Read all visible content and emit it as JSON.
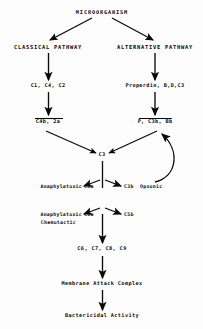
{
  "figure": {
    "type": "flowchart",
    "background_color": "#fdfdfd",
    "ink_color": "#0a0a0a"
  },
  "nodes": {
    "microorganism": "MICROORGANISM",
    "classical_pathway": "CLASSICAL PATHWAY",
    "alternative_pathway": "ALTERNATIVE PATHWAY",
    "classical_components": "C1, C4, C2",
    "alternative_components": "Properdin, B,D,C3",
    "classical_convertase": "C4b, 2a",
    "alternative_convertase": "P, C3b, Bb",
    "c3": "C3",
    "c3a_label": "Anaphylatoxic",
    "c3a": "C3a",
    "c3b": "C3b",
    "c3b_label": "Opsonic",
    "c5a_label_line1": "Anaphylatoxic",
    "c5a_label_line2": "Chemotactic",
    "c5a": "C5a",
    "c5b": "C5b",
    "terminal_components": "C6, C7, C8, C9",
    "membrane_attack_complex": "Membrane Attack Complex",
    "bactericidal_activity": "Bactericidal Activity"
  },
  "edges": [
    {
      "name": "microorganism-to-classical",
      "from": "microorganism",
      "to": "classical_pathway",
      "style": "diagonal-arrow"
    },
    {
      "name": "microorganism-to-alternative",
      "from": "microorganism",
      "to": "alternative_pathway",
      "style": "diagonal-arrow"
    },
    {
      "name": "classical-to-components",
      "from": "classical_pathway",
      "to": "classical_components",
      "style": "vertical-arrow"
    },
    {
      "name": "alternative-to-components",
      "from": "alternative_pathway",
      "to": "alternative_components",
      "style": "vertical-arrow"
    },
    {
      "name": "classical-components-to-convertase",
      "from": "classical_components",
      "to": "classical_convertase",
      "style": "vertical-arrow"
    },
    {
      "name": "alternative-components-to-convertase",
      "from": "alternative_components",
      "to": "alternative_convertase",
      "style": "vertical-arrow"
    },
    {
      "name": "classical-convertase-to-c3",
      "from": "classical_convertase",
      "to": "c3",
      "style": "diagonal-arrow"
    },
    {
      "name": "alternative-convertase-to-c3",
      "from": "alternative_convertase",
      "to": "c3",
      "style": "diagonal-arrow"
    },
    {
      "name": "c3-to-c3a",
      "from": "c3",
      "to": "c3a",
      "style": "split-arrow-left"
    },
    {
      "name": "c3-to-c3b",
      "from": "c3",
      "to": "c3b",
      "style": "split-arrow-right"
    },
    {
      "name": "c3b-feedback-loop",
      "from": "c3b",
      "to": "alternative_convertase",
      "style": "curved-feedback-arrow"
    },
    {
      "name": "c3-to-c5a",
      "from": "c3",
      "to": "c5a",
      "style": "split-arrow-left"
    },
    {
      "name": "c3-to-c5b",
      "from": "c3",
      "to": "c5b",
      "style": "split-arrow-right"
    },
    {
      "name": "c5b-to-terminal",
      "from": "c5b",
      "to": "terminal_components",
      "style": "vertical-arrow"
    },
    {
      "name": "terminal-to-mac",
      "from": "terminal_components",
      "to": "membrane_attack_complex",
      "style": "vertical-arrow"
    },
    {
      "name": "mac-to-bactericidal",
      "from": "membrane_attack_complex",
      "to": "bactericidal_activity",
      "style": "vertical-arrow"
    }
  ]
}
